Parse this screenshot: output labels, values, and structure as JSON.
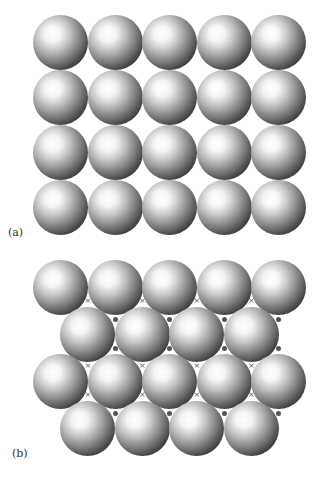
{
  "panels": [
    {
      "label": "(a)",
      "arrangement": "square",
      "rows": 4,
      "columns": 5,
      "origin": [
        33,
        15
      ],
      "pitch_x": 54.5,
      "pitch_y": 55
    },
    {
      "label": "(b)",
      "arrangement": "hexagonal close-packed",
      "rows": 4,
      "row_counts": [
        5,
        4,
        5,
        4
      ],
      "origin": [
        33,
        260
      ],
      "pitch_x": 54.5,
      "pitch_y": 47,
      "interstice_markers": [
        "×",
        "•"
      ]
    }
  ],
  "colors": {
    "sphere_highlight": "#ffffff",
    "sphere_shadow": "#111111",
    "marker": "#555555"
  }
}
